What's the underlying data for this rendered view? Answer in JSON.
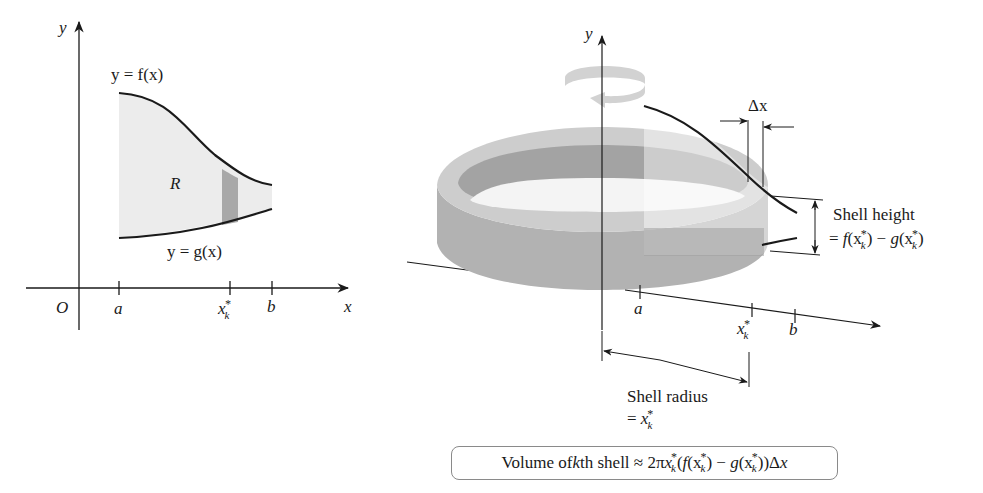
{
  "left_figure": {
    "y_axis_label": "y",
    "x_axis_label": "x",
    "origin_label": "O",
    "curve_top_label": "y = f(x)",
    "curve_bottom_label": "y = g(x)",
    "region_label": "R",
    "tick_a": "a",
    "tick_b": "b",
    "tick_xk": "x",
    "tick_xk_sub": "k",
    "tick_xk_sup": "*",
    "colors": {
      "region_fill": "#ececec",
      "strip_fill": "#a8a8a8",
      "curve": "#1a1a1a"
    }
  },
  "right_figure": {
    "y_axis_label": "y",
    "tick_a": "a",
    "tick_b": "b",
    "tick_xk": "x",
    "tick_xk_sub": "k",
    "tick_xk_sup": "*",
    "delta_x_label": "Δx",
    "shell_height_title": "Shell height",
    "shell_height_formula": {
      "eq": "= ",
      "f": "f",
      "open1": "(x",
      "sub1": "k",
      "sup1": "*",
      "mid": ") − ",
      "g": "g",
      "open2": "(x",
      "sub2": "k",
      "sup2": "*",
      "close": ")"
    },
    "shell_radius_title": "Shell radius",
    "shell_radius_eq": "= ",
    "shell_radius_x": "x",
    "shell_radius_sub": "k",
    "shell_radius_sup": "*",
    "colors": {
      "shell_outer": "#b4b4b4",
      "shell_inner": "#9e9e9e",
      "shell_top": "#cfcfcf",
      "rotation_arrow": "#d2d2d2"
    }
  },
  "formula": {
    "prefix": "Volume of ",
    "k": "k",
    "th_shell": "th shell ≈ 2π",
    "x1": "x",
    "sub1": "k",
    "sup1": "*",
    "open": "(",
    "f": "f",
    "open_f": "(x",
    "sub2": "k",
    "sup2": "*",
    "minus": ") − ",
    "g": "g",
    "open_g": "(x",
    "sub3": "k",
    "sup3": "*",
    "close": "))Δ",
    "x_end": "x"
  }
}
